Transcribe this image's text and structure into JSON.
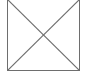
{
  "placeholder": {
    "icon": "image-missing-x-icon",
    "alt_text": "",
    "stroke_color": "#6e6e6e",
    "background_color": "#ffffff"
  }
}
